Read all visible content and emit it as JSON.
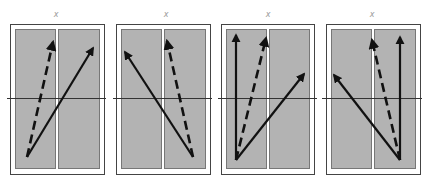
{
  "figure": {
    "colors": {
      "background": "#ffffff",
      "frame": "#444444",
      "strip_fill": "#b3b3b3",
      "strip_border": "#777777",
      "axis_line": "#333333",
      "arrow": "#111111"
    },
    "panels": [
      {
        "label": "x",
        "arrows": [
          {
            "style": "dashed",
            "from": [
              27,
              157
            ],
            "to": [
              53,
              42
            ]
          },
          {
            "style": "solid",
            "from": [
              27,
              157
            ],
            "to": [
              93,
              48
            ]
          }
        ]
      },
      {
        "label": "x",
        "arrows": [
          {
            "style": "solid",
            "from": [
              193,
              157
            ],
            "to": [
              125,
              52
            ]
          },
          {
            "style": "dashed",
            "from": [
              193,
              157
            ],
            "to": [
              167,
              41
            ]
          }
        ]
      },
      {
        "label": "x",
        "arrows": [
          {
            "style": "solid",
            "from": [
              236,
              160
            ],
            "to": [
              236,
              35
            ]
          },
          {
            "style": "dashed",
            "from": [
              236,
              160
            ],
            "to": [
              266,
              38
            ]
          },
          {
            "style": "solid",
            "from": [
              236,
              160
            ],
            "to": [
              304,
              74
            ]
          }
        ]
      },
      {
        "label": "x",
        "arrows": [
          {
            "style": "solid",
            "from": [
              400,
              160
            ],
            "to": [
              400,
              37
            ]
          },
          {
            "style": "dashed",
            "from": [
              400,
              160
            ],
            "to": [
              372,
              40
            ]
          },
          {
            "style": "solid",
            "from": [
              400,
              160
            ],
            "to": [
              334,
              75
            ]
          }
        ]
      }
    ]
  }
}
